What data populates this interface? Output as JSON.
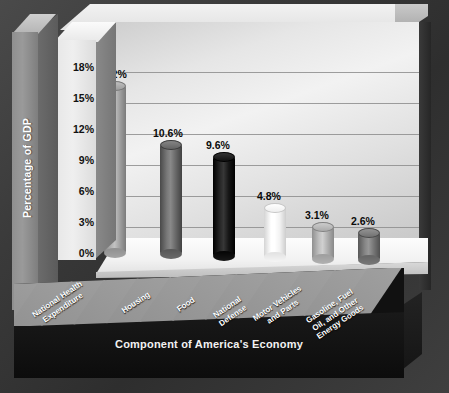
{
  "chart_data": {
    "type": "bar",
    "title": "",
    "xlabel": "Component of America's Economy",
    "ylabel": "Percentage of GDP",
    "categories": [
      "National Health\nExpenditure",
      "Housing",
      "Food",
      "National\nDefense",
      "Motor Vehicles\nand Parts",
      "Gasoline, Fuel\nOil, and Other\nEnergy Goods"
    ],
    "values": [
      16.2,
      10.6,
      9.6,
      4.8,
      3.1,
      2.6
    ],
    "value_labels": [
      "16.2%",
      "10.6%",
      "9.6%",
      "4.8%",
      "3.1%",
      "2.6%"
    ],
    "ylim": [
      0,
      19.5
    ],
    "yticks": [
      0,
      3,
      6,
      9,
      12,
      15,
      18
    ],
    "ytick_labels": [
      "0%",
      "3%",
      "6%",
      "9%",
      "12%",
      "15%",
      "18%"
    ],
    "grid": true,
    "legend": "none",
    "bar_colors": [
      "#a8a8a8",
      "#6f6f6f",
      "#1d1d1d",
      "#fafafa",
      "#b6b6b6",
      "#7d7d7d"
    ],
    "style": "3d-cylinder",
    "background": "#2f2f2f",
    "plot_background": "#e9e9e9"
  }
}
